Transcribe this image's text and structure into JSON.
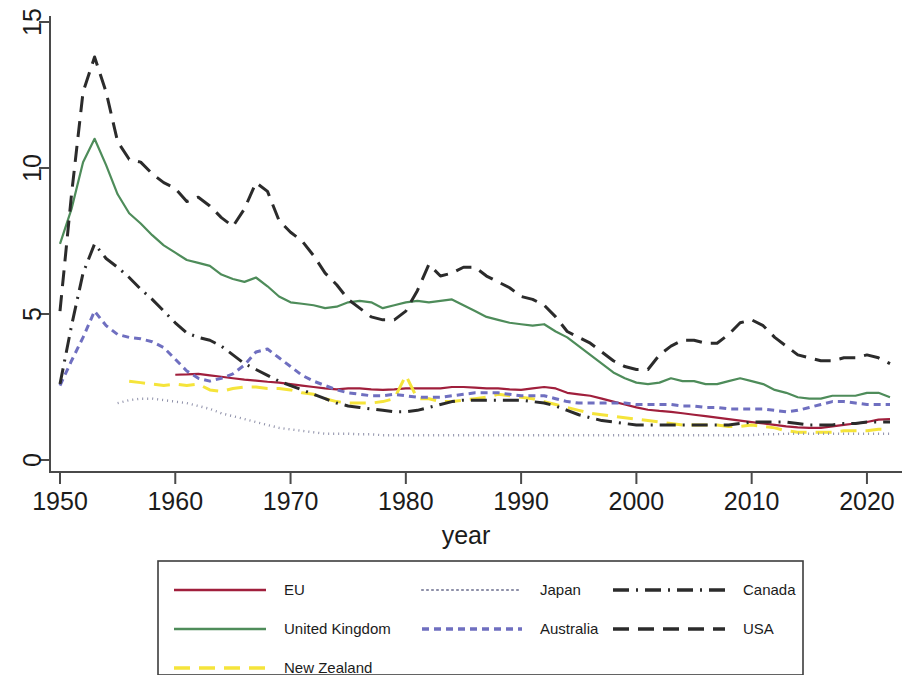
{
  "chart_data": {
    "type": "line",
    "title": "",
    "xlabel": "year",
    "ylabel": "",
    "xlim": [
      1950,
      2022
    ],
    "ylim": [
      0,
      15
    ],
    "xticks": [
      1950,
      1960,
      1970,
      1980,
      1990,
      2000,
      2010,
      2020
    ],
    "xtick_labels": [
      "1950",
      "1960",
      "1970",
      "1980",
      "1990",
      "2000",
      "2010",
      "2020"
    ],
    "yticks": [
      0,
      5,
      10,
      15
    ],
    "ytick_labels": [
      "0",
      "5",
      "10",
      "15"
    ],
    "grid": false,
    "legend_position": "bottom",
    "series": [
      {
        "name": "EU",
        "color": "#a01f3c",
        "dash": "none",
        "x": [
          1960,
          1961,
          1962,
          1963,
          1964,
          1965,
          1966,
          1967,
          1968,
          1969,
          1970,
          1971,
          1972,
          1973,
          1974,
          1975,
          1976,
          1977,
          1978,
          1979,
          1980,
          1981,
          1982,
          1983,
          1984,
          1985,
          1986,
          1987,
          1988,
          1989,
          1990,
          1991,
          1992,
          1993,
          1994,
          1995,
          1996,
          1997,
          1998,
          1999,
          2000,
          2001,
          2002,
          2003,
          2004,
          2005,
          2006,
          2007,
          2008,
          2009,
          2010,
          2011,
          2012,
          2013,
          2014,
          2015,
          2016,
          2017,
          2018,
          2019,
          2020,
          2021,
          2022
        ],
        "values": [
          2.92,
          2.93,
          2.95,
          2.9,
          2.85,
          2.8,
          2.75,
          2.72,
          2.68,
          2.65,
          2.6,
          2.55,
          2.5,
          2.45,
          2.42,
          2.45,
          2.45,
          2.42,
          2.4,
          2.42,
          2.45,
          2.45,
          2.45,
          2.45,
          2.5,
          2.5,
          2.48,
          2.45,
          2.45,
          2.42,
          2.4,
          2.45,
          2.5,
          2.45,
          2.3,
          2.25,
          2.2,
          2.1,
          2.0,
          1.9,
          1.8,
          1.72,
          1.68,
          1.65,
          1.6,
          1.55,
          1.5,
          1.45,
          1.4,
          1.35,
          1.3,
          1.25,
          1.2,
          1.15,
          1.12,
          1.1,
          1.1,
          1.15,
          1.2,
          1.25,
          1.3,
          1.38,
          1.4
        ]
      },
      {
        "name": "United Kingdom",
        "color": "#4e8c5a",
        "dash": "none",
        "x": [
          1950,
          1951,
          1952,
          1953,
          1954,
          1955,
          1956,
          1957,
          1958,
          1959,
          1960,
          1961,
          1962,
          1963,
          1964,
          1965,
          1966,
          1967,
          1968,
          1969,
          1970,
          1971,
          1972,
          1973,
          1974,
          1975,
          1976,
          1977,
          1978,
          1979,
          1980,
          1981,
          1982,
          1983,
          1984,
          1985,
          1986,
          1987,
          1988,
          1989,
          1990,
          1991,
          1992,
          1993,
          1994,
          1995,
          1996,
          1997,
          1998,
          1999,
          2000,
          2001,
          2002,
          2003,
          2004,
          2005,
          2006,
          2007,
          2008,
          2009,
          2010,
          2011,
          2012,
          2013,
          2014,
          2015,
          2016,
          2017,
          2018,
          2019,
          2020,
          2021,
          2022
        ],
        "values": [
          7.4,
          8.6,
          10.2,
          11.0,
          10.1,
          9.1,
          8.45,
          8.1,
          7.7,
          7.35,
          7.1,
          6.85,
          6.75,
          6.65,
          6.35,
          6.2,
          6.1,
          6.25,
          5.95,
          5.6,
          5.4,
          5.35,
          5.3,
          5.2,
          5.25,
          5.4,
          5.45,
          5.4,
          5.2,
          5.3,
          5.4,
          5.45,
          5.4,
          5.45,
          5.5,
          5.3,
          5.1,
          4.9,
          4.8,
          4.7,
          4.65,
          4.6,
          4.65,
          4.4,
          4.2,
          3.9,
          3.6,
          3.3,
          3.0,
          2.8,
          2.65,
          2.6,
          2.65,
          2.8,
          2.7,
          2.7,
          2.6,
          2.6,
          2.7,
          2.8,
          2.7,
          2.6,
          2.4,
          2.3,
          2.15,
          2.1,
          2.1,
          2.2,
          2.2,
          2.2,
          2.3,
          2.3,
          2.15
        ]
      },
      {
        "name": "New Zealand",
        "color": "#f5e43a",
        "dash": "long",
        "x": [
          1956,
          1957,
          1958,
          1959,
          1960,
          1961,
          1962,
          1963,
          1964,
          1965,
          1966,
          1967,
          1968,
          1969,
          1970,
          1971,
          1972,
          1973,
          1974,
          1975,
          1976,
          1977,
          1978,
          1979,
          1980,
          1981,
          1982,
          1983,
          1984,
          1985,
          1986,
          1987,
          1988,
          1989,
          1990,
          1991,
          1992,
          1993,
          1994,
          1995,
          1996,
          1997,
          1998,
          1999,
          2000,
          2001,
          2002,
          2003,
          2004,
          2005,
          2006,
          2007,
          2008,
          2009,
          2010,
          2011,
          2012,
          2013,
          2014,
          2015,
          2016,
          2017,
          2018,
          2019,
          2020,
          2021,
          2022
        ],
        "values": [
          2.7,
          2.65,
          2.6,
          2.55,
          2.6,
          2.55,
          2.6,
          2.4,
          2.35,
          2.45,
          2.5,
          2.5,
          2.45,
          2.45,
          2.4,
          2.3,
          2.25,
          2.1,
          2.0,
          1.95,
          1.95,
          1.95,
          2.0,
          2.1,
          2.9,
          2.1,
          2.1,
          2.0,
          2.0,
          2.05,
          2.1,
          2.15,
          2.25,
          2.2,
          2.15,
          2.1,
          2.0,
          1.9,
          1.8,
          1.7,
          1.6,
          1.55,
          1.5,
          1.45,
          1.4,
          1.35,
          1.3,
          1.25,
          1.2,
          1.2,
          1.2,
          1.2,
          1.15,
          1.15,
          1.2,
          1.15,
          1.1,
          1.0,
          0.95,
          0.95,
          0.95,
          0.95,
          1.0,
          1.0,
          1.0,
          1.05,
          1.05
        ]
      },
      {
        "name": "Japan",
        "color": "#8d8fa8",
        "dash": "dot",
        "x": [
          1955,
          1956,
          1957,
          1958,
          1959,
          1960,
          1961,
          1962,
          1963,
          1964,
          1965,
          1966,
          1967,
          1968,
          1969,
          1970,
          1971,
          1972,
          1973,
          1974,
          1975,
          1976,
          1977,
          1978,
          1979,
          1980,
          1981,
          1982,
          1983,
          1984,
          1985,
          1986,
          1987,
          1988,
          1989,
          1990,
          1991,
          1992,
          1993,
          1994,
          1995,
          1996,
          1997,
          1998,
          1999,
          2000,
          2001,
          2002,
          2003,
          2004,
          2005,
          2006,
          2007,
          2008,
          2009,
          2010,
          2011,
          2012,
          2013,
          2014,
          2015,
          2016,
          2017,
          2018,
          2019,
          2020,
          2021,
          2022
        ],
        "values": [
          1.95,
          2.05,
          2.1,
          2.1,
          2.05,
          2.0,
          1.95,
          1.85,
          1.75,
          1.6,
          1.5,
          1.4,
          1.3,
          1.2,
          1.1,
          1.05,
          1.0,
          0.95,
          0.9,
          0.9,
          0.9,
          0.88,
          0.88,
          0.85,
          0.85,
          0.85,
          0.85,
          0.85,
          0.85,
          0.85,
          0.85,
          0.85,
          0.85,
          0.85,
          0.85,
          0.85,
          0.85,
          0.85,
          0.85,
          0.85,
          0.85,
          0.85,
          0.85,
          0.85,
          0.85,
          0.85,
          0.85,
          0.85,
          0.85,
          0.85,
          0.85,
          0.85,
          0.85,
          0.85,
          0.85,
          0.85,
          0.88,
          0.88,
          0.9,
          0.9,
          0.9,
          0.9,
          0.9,
          0.9,
          0.9,
          0.9,
          0.9,
          0.9
        ]
      },
      {
        "name": "Australia",
        "color": "#6f6fc0",
        "dash": "short",
        "x": [
          1950,
          1951,
          1952,
          1953,
          1954,
          1955,
          1956,
          1957,
          1958,
          1959,
          1960,
          1961,
          1962,
          1963,
          1964,
          1965,
          1966,
          1967,
          1968,
          1969,
          1970,
          1971,
          1972,
          1973,
          1974,
          1975,
          1976,
          1977,
          1978,
          1979,
          1980,
          1981,
          1982,
          1983,
          1984,
          1985,
          1986,
          1987,
          1988,
          1989,
          1990,
          1991,
          1992,
          1993,
          1994,
          1995,
          1996,
          1997,
          1998,
          1999,
          2000,
          2001,
          2002,
          2003,
          2004,
          2005,
          2006,
          2007,
          2008,
          2009,
          2010,
          2011,
          2012,
          2013,
          2014,
          2015,
          2016,
          2017,
          2018,
          2019,
          2020,
          2021,
          2022
        ],
        "values": [
          2.55,
          3.4,
          4.2,
          5.1,
          4.6,
          4.3,
          4.2,
          4.15,
          4.05,
          3.85,
          3.45,
          3.05,
          2.8,
          2.7,
          2.8,
          2.95,
          3.25,
          3.7,
          3.8,
          3.5,
          3.2,
          2.9,
          2.7,
          2.55,
          2.4,
          2.3,
          2.25,
          2.2,
          2.2,
          2.25,
          2.2,
          2.15,
          2.15,
          2.15,
          2.2,
          2.25,
          2.3,
          2.3,
          2.3,
          2.25,
          2.2,
          2.2,
          2.2,
          2.1,
          2.0,
          1.95,
          1.95,
          1.95,
          1.95,
          1.95,
          1.9,
          1.9,
          1.9,
          1.9,
          1.85,
          1.85,
          1.8,
          1.8,
          1.75,
          1.75,
          1.75,
          1.75,
          1.7,
          1.65,
          1.7,
          1.8,
          1.9,
          2.0,
          2.0,
          1.95,
          1.9,
          1.9,
          1.9
        ]
      },
      {
        "name": "Canada",
        "color": "#2b2b2b",
        "dash": "dashdot",
        "x": [
          1950,
          1951,
          1952,
          1953,
          1954,
          1955,
          1956,
          1957,
          1958,
          1959,
          1960,
          1961,
          1962,
          1963,
          1964,
          1965,
          1966,
          1967,
          1968,
          1969,
          1970,
          1971,
          1972,
          1973,
          1974,
          1975,
          1976,
          1977,
          1978,
          1979,
          1980,
          1981,
          1982,
          1983,
          1984,
          1985,
          1986,
          1987,
          1988,
          1989,
          1990,
          1991,
          1992,
          1993,
          1994,
          1995,
          1996,
          1997,
          1998,
          1999,
          2000,
          2001,
          2002,
          2003,
          2004,
          2005,
          2006,
          2007,
          2008,
          2009,
          2010,
          2011,
          2012,
          2013,
          2014,
          2015,
          2016,
          2017,
          2018,
          2019,
          2020,
          2021,
          2022
        ],
        "values": [
          2.6,
          4.6,
          6.4,
          7.4,
          6.9,
          6.6,
          6.25,
          5.85,
          5.5,
          5.1,
          4.7,
          4.35,
          4.2,
          4.1,
          3.9,
          3.6,
          3.3,
          3.1,
          2.9,
          2.7,
          2.55,
          2.4,
          2.25,
          2.1,
          1.95,
          1.85,
          1.8,
          1.75,
          1.7,
          1.65,
          1.65,
          1.7,
          1.8,
          1.9,
          2.0,
          2.05,
          2.05,
          2.05,
          2.05,
          2.05,
          2.05,
          2.0,
          1.95,
          1.85,
          1.7,
          1.55,
          1.45,
          1.35,
          1.3,
          1.25,
          1.2,
          1.2,
          1.2,
          1.2,
          1.2,
          1.2,
          1.2,
          1.2,
          1.2,
          1.25,
          1.3,
          1.3,
          1.3,
          1.3,
          1.25,
          1.2,
          1.2,
          1.2,
          1.25,
          1.25,
          1.3,
          1.3,
          1.3
        ]
      },
      {
        "name": "USA",
        "color": "#2b2b2b",
        "dash": "long",
        "x": [
          1950,
          1951,
          1952,
          1953,
          1954,
          1955,
          1956,
          1957,
          1958,
          1959,
          1960,
          1961,
          1962,
          1963,
          1964,
          1965,
          1966,
          1967,
          1968,
          1969,
          1970,
          1971,
          1972,
          1973,
          1974,
          1975,
          1976,
          1977,
          1978,
          1979,
          1980,
          1981,
          1982,
          1983,
          1984,
          1985,
          1986,
          1987,
          1988,
          1989,
          1990,
          1991,
          1992,
          1993,
          1994,
          1995,
          1996,
          1997,
          1998,
          1999,
          2000,
          2001,
          2002,
          2003,
          2004,
          2005,
          2006,
          2007,
          2008,
          2009,
          2010,
          2011,
          2012,
          2013,
          2014,
          2015,
          2016,
          2017,
          2018,
          2019,
          2020,
          2021,
          2022
        ],
        "values": [
          5.1,
          9.1,
          12.6,
          13.8,
          12.6,
          10.9,
          10.3,
          10.2,
          9.8,
          9.5,
          9.3,
          8.85,
          9.0,
          8.7,
          8.3,
          8.0,
          8.6,
          9.5,
          9.2,
          8.2,
          7.8,
          7.5,
          7.0,
          6.4,
          6.0,
          5.5,
          5.2,
          4.9,
          4.8,
          4.8,
          5.1,
          5.8,
          6.7,
          6.3,
          6.4,
          6.6,
          6.6,
          6.3,
          6.1,
          5.9,
          5.6,
          5.5,
          5.3,
          4.9,
          4.4,
          4.2,
          4.0,
          3.7,
          3.4,
          3.2,
          3.1,
          3.1,
          3.6,
          3.9,
          4.1,
          4.1,
          4.0,
          4.0,
          4.3,
          4.7,
          4.8,
          4.6,
          4.2,
          3.9,
          3.6,
          3.5,
          3.4,
          3.4,
          3.5,
          3.5,
          3.6,
          3.5,
          3.3
        ]
      }
    ]
  },
  "legend": {
    "columns": [
      [
        {
          "label": "EU",
          "key": "EU"
        },
        {
          "label": "United Kingdom",
          "key": "United Kingdom"
        },
        {
          "label": "New Zealand",
          "key": "New Zealand"
        }
      ],
      [
        {
          "label": "Japan",
          "key": "Japan"
        },
        {
          "label": "Australia",
          "key": "Australia"
        }
      ],
      [
        {
          "label": "Canada",
          "key": "Canada"
        },
        {
          "label": "USA",
          "key": "USA"
        }
      ]
    ]
  }
}
